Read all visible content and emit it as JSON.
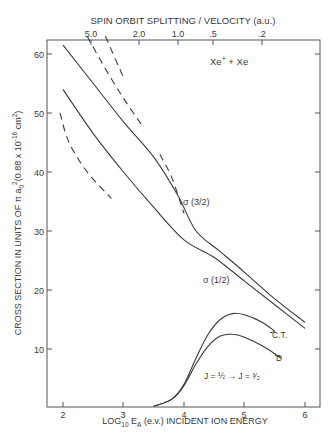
{
  "chart_data": {
    "type": "line",
    "title": "Xe+ + Xe",
    "xlabel": "LOG10 EA (e.v.) INCIDENT ION ENERGY",
    "ylabel": "CROSS SECTION IN UNITS OF π a0² (0.88 x 10^-16 cm²)",
    "top_xlabel": "SPIN ORBIT SPLITTING / VELOCITY (a.u.)",
    "xlim": [
      1.75,
      6.25
    ],
    "ylim": [
      0,
      63
    ],
    "x_ticks": [
      "2",
      "3",
      "4",
      "5",
      "6"
    ],
    "y_ticks": [
      "10",
      "20",
      "30",
      "40",
      "50",
      "60"
    ],
    "top_ticks": [
      "5.0",
      "2.0",
      "1.0",
      ".5",
      ".2"
    ],
    "grid": false,
    "legend": "inline labels",
    "annotations": [
      "Xe+ + Xe",
      "σ (3/2)",
      "σ (1/2)",
      "C.T.",
      "D",
      "J = 1/2 → J = 3/2"
    ],
    "series": [
      {
        "name": "σ(3/2)",
        "style": "solid",
        "x": [
          2.0,
          2.5,
          3.0,
          3.5,
          3.9,
          4.2,
          4.6,
          5.0,
          5.5,
          6.0
        ],
        "y": [
          61.5,
          55,
          48.5,
          42.5,
          36,
          30,
          26.5,
          23,
          18.5,
          14.5
        ]
      },
      {
        "name": "σ(1/2)",
        "style": "solid",
        "x": [
          2.0,
          2.5,
          3.0,
          3.5,
          4.0,
          4.5,
          5.0,
          5.5,
          6.0
        ],
        "y": [
          54,
          46.5,
          40,
          34,
          28.5,
          25.5,
          21.5,
          17.5,
          13.5
        ]
      },
      {
        "name": "C.T.",
        "style": "solid",
        "x": [
          3.5,
          3.8,
          4.0,
          4.2,
          4.4,
          4.6,
          4.8,
          5.0,
          5.3,
          5.5
        ],
        "y": [
          0.3,
          1.5,
          4,
          8.5,
          12.5,
          15,
          16,
          15.8,
          14.5,
          13
        ]
      },
      {
        "name": "D",
        "style": "solid",
        "x": [
          3.5,
          3.8,
          4.0,
          4.2,
          4.4,
          4.6,
          4.8,
          5.0,
          5.3,
          5.6
        ],
        "y": [
          0.3,
          1.5,
          3.8,
          7.5,
          10.5,
          12.2,
          12.5,
          12,
          10.5,
          8.5
        ]
      },
      {
        "name": "dashed-1",
        "style": "dashed",
        "x": [
          2.7,
          3.0
        ],
        "y": [
          63,
          56
        ]
      },
      {
        "name": "dashed-2",
        "style": "dashed",
        "x": [
          2.4,
          2.7,
          3.0,
          3.3
        ],
        "y": [
          63,
          57.5,
          52.5,
          48
        ]
      },
      {
        "name": "dashed-3",
        "style": "dashed",
        "x": [
          3.6,
          3.8,
          4.0
        ],
        "y": [
          43,
          39,
          33
        ]
      },
      {
        "name": "dashed-4",
        "style": "dashed",
        "x": [
          1.95,
          2.1,
          2.4,
          2.8
        ],
        "y": [
          50,
          45,
          40,
          35.5
        ]
      }
    ]
  },
  "labels": {
    "top_axis_title": "SPIN ORBIT SPLITTING / VELOCITY (a.u.)",
    "y_axis_title": "CROSS SECTION IN UNITS OF π a",
    "y_axis_sub0": "0",
    "y_axis_sup2": "2",
    "y_axis_rest": "(0.88 x 10",
    "y_axis_exp": "-16",
    "y_axis_cm": " cm",
    "y_axis_cm2": "2",
    "y_axis_close": ")",
    "x_axis_log": "LOG",
    "x_axis_sub10": "10",
    "x_axis_E": " E",
    "x_axis_subA": "A",
    "x_axis_rest": " (e.v.) INCIDENT ION ENERGY",
    "reaction_xe": "Xe",
    "reaction_plus": "+",
    "reaction_rest": " + Xe",
    "sigma32": "σ (3/2)",
    "sigma12": "σ (1/2)",
    "ct": "C.T.",
    "d": "D",
    "transition": "J = ½ → J = ³⁄₂"
  },
  "ticks": {
    "x": [
      {
        "label": "2",
        "px": 63
      },
      {
        "label": "3",
        "px": 123
      },
      {
        "label": "4",
        "px": 184
      },
      {
        "label": "5",
        "px": 244
      },
      {
        "label": "6",
        "px": 305
      }
    ],
    "y": [
      {
        "label": "60",
        "py": 54
      },
      {
        "label": "50",
        "py": 113
      },
      {
        "label": "40",
        "py": 172
      },
      {
        "label": "30",
        "py": 231
      },
      {
        "label": "20",
        "py": 290
      },
      {
        "label": "10",
        "py": 349
      }
    ],
    "top": [
      {
        "label": "5.0",
        "px": 91
      },
      {
        "label": "2.0",
        "px": 139
      },
      {
        "label": "1.0",
        "px": 178
      },
      {
        "label": ".5",
        "px": 213
      },
      {
        "label": ".2",
        "px": 262
      }
    ]
  }
}
